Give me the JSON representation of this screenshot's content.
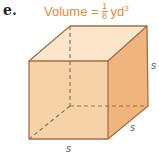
{
  "problem_label": "e.",
  "formula": {
    "prefix": "Volume = ",
    "numerator": "1",
    "denominator": "8",
    "unit": "yd",
    "exponent": "3"
  },
  "figure": {
    "shape": "cube",
    "edge_labels": [
      "s",
      "s",
      "s"
    ],
    "colors": {
      "front": "#f6d2a8",
      "top": "#fbe6cc",
      "side": "#efb57c",
      "edge": "#a0704a",
      "accent": "#e08a3a"
    }
  }
}
